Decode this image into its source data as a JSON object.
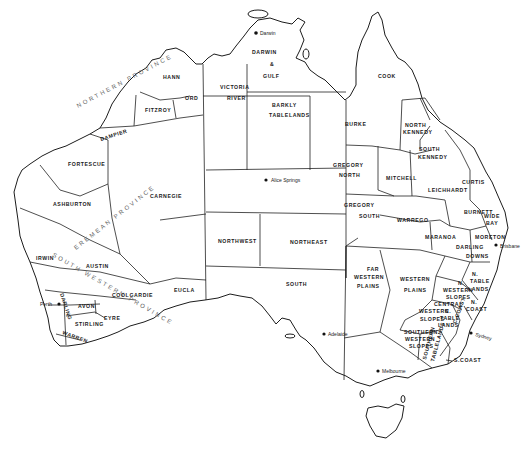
{
  "map": {
    "subject": "Australia pastoral / land regions",
    "provinces": {
      "northern": "NORTHERN PROVINCE",
      "eremean": "EREMEAN PROVINCE",
      "south_western": "SOUTH WESTERN PROVINCE"
    },
    "regions": {
      "hann": "HANN",
      "fitzroy": "FITZROY",
      "ord": "ORD",
      "dampier": "DAMPIER",
      "fortescue": "FORTESCUE",
      "ashburton": "ASHBURTON",
      "carnegie": "CARNEGIE",
      "irwin": "IRWIN",
      "austin": "AUSTIN",
      "coolgardie": "COOLGARDIE",
      "darling_wa": "DARLING",
      "avon": "AVON",
      "stirling": "STIRLING",
      "eyre": "EYRE",
      "warren": "WARREN",
      "eucla": "EUCLA",
      "victoria_river_1": "VICTORIA",
      "victoria_river_2": "RIVER",
      "darwin_gulf_1": "DARWIN",
      "darwin_gulf_2": "&",
      "darwin_gulf_3": "GULF",
      "barkly_1": "BARKLY",
      "barkly_2": "TABLELANDS",
      "northwest": "NORTHWEST",
      "northeast": "NORTHEAST",
      "south": "SOUTH",
      "cook": "COOK",
      "burke": "BURKE",
      "north_kennedy_1": "NORTH",
      "north_kennedy_2": "KENNEDY",
      "south_kennedy_1": "SOUTH",
      "south_kennedy_2": "KENNEDY",
      "gregory_north_1": "GREGORY",
      "gregory_north_2": "NORTH",
      "gregory_south_1": "GREGORY",
      "gregory_south_2": "SOUTH",
      "mitchell": "MITCHELL",
      "leichhardt": "LEICHHARDT",
      "curtis": "CURTIS",
      "warrego": "WARREGO",
      "maranoa": "MARANOA",
      "burnett": "BURNETT",
      "wide_bay_1": "WIDE",
      "wide_bay_2": "BAY",
      "moreton": "MORETON",
      "darling_downs_1": "DARLING",
      "darling_downs_2": "DOWNS",
      "far_western_plains_1": "FAR",
      "far_western_plains_2": "WESTERN",
      "far_western_plains_3": "PLAINS",
      "western_plains_1": "WESTERN",
      "western_plains_2": "PLAINS",
      "n_western_slopes_1": "N.",
      "n_western_slopes_2": "WESTERN",
      "n_western_slopes_3": "SLOPES",
      "n_tablelands_1": "N.",
      "n_tablelands_2": "TABLE",
      "n_tablelands_3": "LANDS",
      "n_coast_1": "N.",
      "n_coast_2": "COAST",
      "central_western_slopes_1": "CENTRAL",
      "central_western_slopes_2": "WESTERN",
      "central_western_slopes_3": "SLOPES",
      "c_tablelands_1": "C.",
      "c_tablelands_2": "TABLE",
      "c_tablelands_3": "LANDS",
      "c_coast": "C.COAST",
      "southern_western_slopes_1": "SOUTHERN",
      "southern_western_slopes_2": "WESTERN",
      "southern_western_slopes_3": "SLOPES",
      "southern_tablelands_1": "SOUTHERN",
      "southern_tablelands_2": "TABLELANDS",
      "s_coast": "S.COAST"
    },
    "cities": {
      "darwin": "Darwin",
      "alice_springs": "Alice Springs",
      "perth": "Perth",
      "adelaide": "Adelaide",
      "melbourne": "Melbourne",
      "sydney": "Sydney",
      "brisbane": "Brisbane"
    },
    "colors": {
      "line": "#1c1c1c",
      "background": "#ffffff"
    }
  }
}
